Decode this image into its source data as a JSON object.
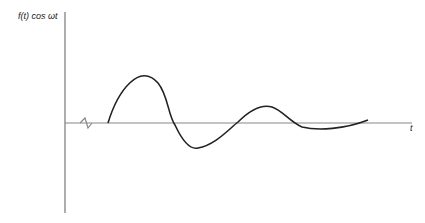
{
  "diagram": {
    "y_label": "f(t) cos ωt",
    "x_label": "t"
  }
}
